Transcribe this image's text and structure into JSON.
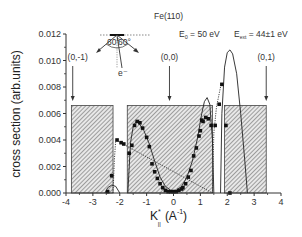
{
  "chart_data": {
    "type": "line",
    "title": "Fe(110)",
    "annotations": {
      "e0": {
        "main": "E",
        "sub": "0",
        "rest": " = 50 eV"
      },
      "ext": {
        "main": "E",
        "sub": "ext",
        "rest": " = 44±1 eV"
      },
      "beams": [
        {
          "label": "(0,-1)",
          "x": -3.75
        },
        {
          "label": "(0,0)",
          "x": -0.15
        },
        {
          "label": "(0,1)",
          "x": 3.45
        }
      ],
      "geometry_inset": {
        "angle_left": "60°",
        "angle_right": "60°",
        "electron": "e⁻"
      }
    },
    "xlabel": "K*||  (A⁻¹)",
    "xlabel_parts": {
      "k": "K",
      "sup": "*",
      "sub": "||",
      "unit": "(A",
      "unit_sup": "-1",
      "close": ")"
    },
    "ylabel": "cross section (arb.units)",
    "xlim": [
      -4,
      4
    ],
    "ylim": [
      0,
      0.012
    ],
    "xticks": [
      "-4",
      "-3",
      "-2",
      "-1",
      "0",
      "1",
      "2",
      "3",
      "4"
    ],
    "yticks": [
      "0.000",
      "0.002",
      "0.004",
      "0.006",
      "0.008",
      "0.010",
      "0.012"
    ],
    "grid": false,
    "hatched_regions": [
      {
        "x0": -3.8,
        "x1": -2.25,
        "height": 0.0066
      },
      {
        "x0": -1.72,
        "x1": 1.45,
        "height": 0.0066
      },
      {
        "x0": 1.9,
        "x1": 3.45,
        "height": 0.0066
      }
    ],
    "series": [
      {
        "name": "measured",
        "style": "scatter",
        "points": [
          [
            -2.45,
            0.0001
          ],
          [
            -2.3,
            0.0013
          ],
          [
            -2.1,
            0.004
          ],
          [
            -1.95,
            0.0038
          ],
          [
            -1.85,
            0.0037
          ],
          [
            -1.65,
            0.003
          ],
          [
            -1.55,
            0.0036
          ],
          [
            -1.45,
            0.0051
          ],
          [
            -1.35,
            0.0054
          ],
          [
            -1.25,
            0.0053
          ],
          [
            -1.15,
            0.0049
          ],
          [
            -1.0,
            0.0042
          ],
          [
            -0.9,
            0.0035
          ],
          [
            -0.8,
            0.0022
          ],
          [
            -0.7,
            0.0016
          ],
          [
            -0.6,
            0.0011
          ],
          [
            -0.5,
            0.0007
          ],
          [
            -0.4,
            0.0004
          ],
          [
            -0.3,
            0.0002
          ],
          [
            -0.2,
            0.0001
          ],
          [
            -0.1,
            0.0001
          ],
          [
            0.0,
            0.0001
          ],
          [
            0.1,
            0.0001
          ],
          [
            0.2,
            0.0002
          ],
          [
            0.3,
            0.0003
          ],
          [
            0.35,
            0.0004
          ],
          [
            0.45,
            0.0007
          ],
          [
            0.55,
            0.0012
          ],
          [
            0.65,
            0.0017
          ],
          [
            0.75,
            0.0028
          ],
          [
            0.85,
            0.0034
          ],
          [
            0.95,
            0.0043
          ],
          [
            1.0,
            0.0047
          ],
          [
            1.05,
            0.0055
          ],
          [
            1.1,
            0.0054
          ],
          [
            1.2,
            0.0057
          ],
          [
            1.3,
            0.0056
          ],
          [
            1.4,
            0.0051
          ],
          [
            1.55,
            0.0051
          ],
          [
            1.7,
            0.0067
          ],
          [
            1.8,
            0.0082
          ],
          [
            1.95,
            0.0051
          ],
          [
            2.1,
            0.0
          ]
        ]
      },
      {
        "name": "model (solid)",
        "style": "solid",
        "points": [
          [
            -1.7,
            0.0
          ],
          [
            -1.6,
            0.0038
          ],
          [
            -1.5,
            0.005
          ],
          [
            -1.4,
            0.0054
          ],
          [
            -1.3,
            0.0053
          ],
          [
            -1.1,
            0.0047
          ],
          [
            -0.9,
            0.0037
          ],
          [
            -0.7,
            0.0024
          ],
          [
            -0.5,
            0.0012
          ],
          [
            -0.3,
            0.0005
          ],
          [
            -0.1,
            0.0002
          ],
          [
            0.1,
            0.0002
          ],
          [
            0.3,
            0.0005
          ],
          [
            0.5,
            0.0012
          ],
          [
            0.7,
            0.0024
          ],
          [
            0.9,
            0.0042
          ],
          [
            1.05,
            0.006
          ],
          [
            1.15,
            0.0069
          ],
          [
            1.25,
            0.0072
          ],
          [
            1.35,
            0.0067
          ],
          [
            1.45,
            0.004
          ],
          [
            1.5,
            0.0
          ]
        ]
      },
      {
        "name": "model (solid, right peak)",
        "style": "solid",
        "points": [
          [
            1.75,
            0.0
          ],
          [
            1.8,
            0.006
          ],
          [
            1.9,
            0.0095
          ],
          [
            2.0,
            0.0106
          ],
          [
            2.1,
            0.0108
          ],
          [
            2.2,
            0.0105
          ],
          [
            2.35,
            0.009
          ],
          [
            2.5,
            0.006
          ],
          [
            2.65,
            0.0025
          ],
          [
            2.75,
            0.0
          ]
        ]
      },
      {
        "name": "model (solid, left bump)",
        "style": "solid",
        "points": [
          [
            -2.55,
            0.0
          ],
          [
            -2.45,
            0.0004
          ],
          [
            -2.3,
            0.0006
          ],
          [
            -2.15,
            0.0005
          ],
          [
            -2.0,
            0.0
          ]
        ]
      },
      {
        "name": "model (dotted)",
        "style": "dotted",
        "points": [
          [
            -2.25,
            0.0
          ],
          [
            -2.2,
            0.0025
          ],
          [
            -2.15,
            0.004
          ],
          [
            1.45,
            0.0
          ],
          [
            1.5,
            0.0045
          ],
          [
            1.6,
            0.0065
          ],
          [
            1.7,
            0.0075
          ],
          [
            1.75,
            0.008
          ]
        ]
      }
    ]
  }
}
